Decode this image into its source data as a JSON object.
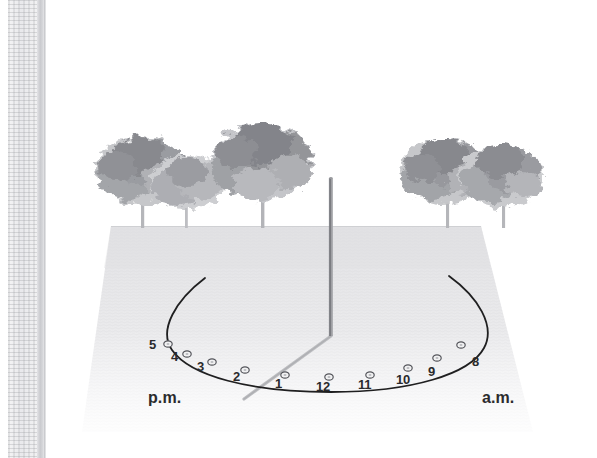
{
  "figure": {
    "kind": "sundial-diagram",
    "scene_description": "Outdoor sundial on a lawn with trees on the horizon",
    "ground": {
      "label": "lawn-ground-plane",
      "color": "#e6e6e8"
    },
    "sky": {
      "label": "sky-background",
      "color": "#ffffff"
    }
  },
  "gnomon": {
    "name": "gnomon-rod",
    "color": "#8d8e92",
    "top": {
      "x": 331,
      "y": 178
    },
    "base": {
      "x": 331,
      "y": 336
    }
  },
  "shadow": {
    "name": "gnomon-shadow",
    "color": "#b9babd",
    "from": {
      "x": 331,
      "y": 336
    },
    "to": {
      "x": 244,
      "y": 399
    }
  },
  "hour_arc": {
    "name": "hour-arc",
    "color": "#1f1f20",
    "start": {
      "x": 205,
      "y": 278
    },
    "end": {
      "x": 449,
      "y": 276
    }
  },
  "periods": {
    "pm": {
      "label": "p.m.",
      "x": 148,
      "y": 390
    },
    "am": {
      "label": "a.m.",
      "x": 482,
      "y": 390
    }
  },
  "hour_markers": [
    {
      "label": "5",
      "marker_x": 168,
      "marker_y": 344,
      "label_x": 149,
      "label_y": 338
    },
    {
      "label": "4",
      "marker_x": 187,
      "marker_y": 354,
      "label_x": 171,
      "label_y": 350
    },
    {
      "label": "3",
      "marker_x": 212,
      "marker_y": 362,
      "label_x": 197,
      "label_y": 360
    },
    {
      "label": "2",
      "marker_x": 245,
      "marker_y": 370,
      "label_x": 233,
      "label_y": 370
    },
    {
      "label": "1",
      "marker_x": 285,
      "marker_y": 375,
      "label_x": 275,
      "label_y": 377
    },
    {
      "label": "12",
      "marker_x": 329,
      "marker_y": 377,
      "label_x": 316,
      "label_y": 380
    },
    {
      "label": "11",
      "marker_x": 370,
      "marker_y": 375,
      "label_x": 358,
      "label_y": 378
    },
    {
      "label": "10",
      "marker_x": 408,
      "marker_y": 368,
      "label_x": 396,
      "label_y": 373
    },
    {
      "label": "9",
      "marker_x": 437,
      "marker_y": 358,
      "label_x": 428,
      "label_y": 365
    },
    {
      "label": "8",
      "marker_x": 461,
      "marker_y": 345,
      "label_x": 472,
      "label_y": 355
    }
  ],
  "trees": [
    {
      "name": "tree-left-1",
      "trunk_x": 143,
      "ground_y": 227,
      "crown_cx": 140,
      "crown_cy": 168,
      "crown_rx": 46,
      "crown_ry": 36
    },
    {
      "name": "tree-left-2",
      "trunk_x": 187,
      "ground_y": 227,
      "crown_cx": 186,
      "crown_cy": 180,
      "crown_rx": 40,
      "crown_ry": 30
    },
    {
      "name": "tree-left-3",
      "trunk_x": 263,
      "ground_y": 227,
      "crown_cx": 261,
      "crown_cy": 160,
      "crown_rx": 52,
      "crown_ry": 40
    },
    {
      "name": "tree-right-1",
      "trunk_x": 447,
      "ground_y": 227,
      "crown_cx": 443,
      "crown_cy": 170,
      "crown_rx": 44,
      "crown_ry": 33
    },
    {
      "name": "tree-right-2",
      "trunk_x": 503,
      "ground_y": 227,
      "crown_cx": 500,
      "crown_cy": 175,
      "crown_rx": 42,
      "crown_ry": 32
    }
  ],
  "colors": {
    "foliage_dark": "#8a8c90",
    "foliage_mid": "#a9abaf",
    "foliage_light": "#c9cacd",
    "trunk": "#b3b4b8",
    "ground_top": "#e4e4e7",
    "ground_bottom": "#f3f3f4",
    "arc_stroke": "#1f1f20",
    "marker_fill": "#f2f2f3",
    "marker_stroke": "#53545a",
    "text": "#2a2a2c"
  }
}
